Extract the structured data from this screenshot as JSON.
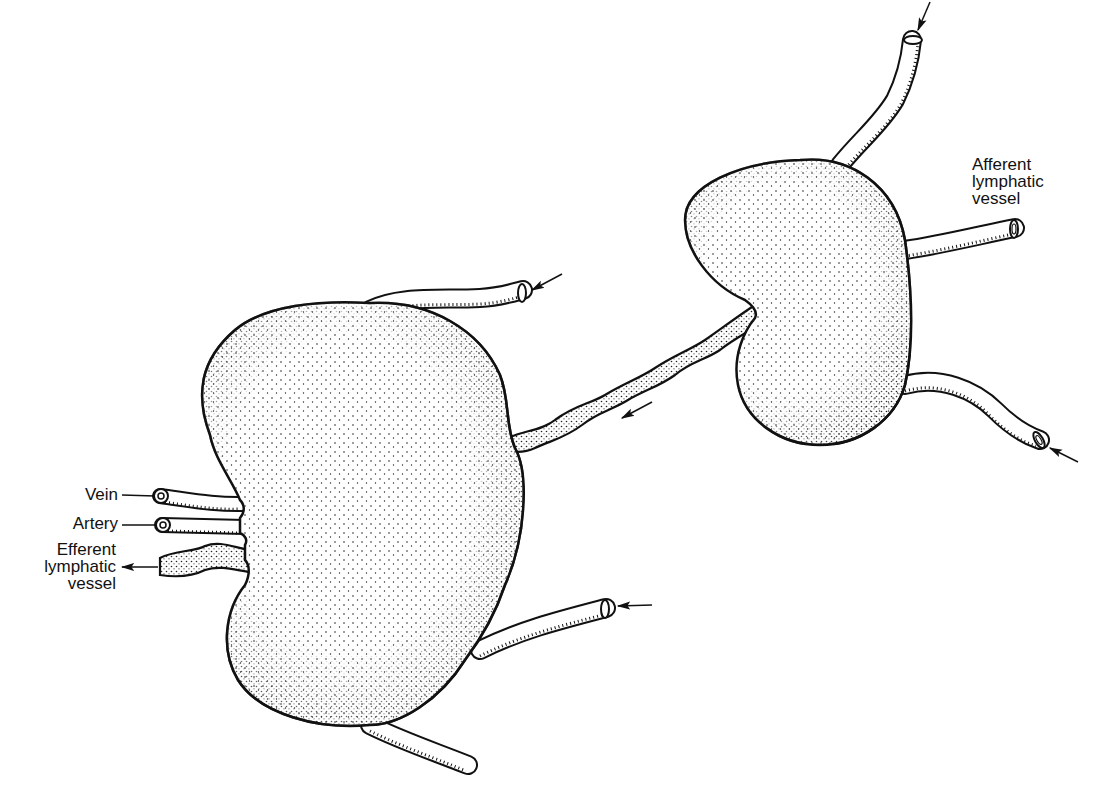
{
  "diagram": {
    "type": "anatomical illustration",
    "labels": {
      "vein": "Vein",
      "artery": "Artery",
      "efferent_1": "Efferent",
      "efferent_2": "lymphatic",
      "efferent_3": "vessel",
      "afferent_1": "Afferent",
      "afferent_2": "lymphatic",
      "afferent_3": "vessel"
    },
    "nodes": [
      {
        "name": "large-lymph-node",
        "position": "left"
      },
      {
        "name": "small-lymph-node",
        "position": "upper-right"
      }
    ],
    "arrows": [
      {
        "name": "arrow-top-right-vessel",
        "direction": "into small node"
      },
      {
        "name": "arrow-right-vessel",
        "direction": "into small node"
      },
      {
        "name": "arrow-lower-right-vessel",
        "direction": "into small node"
      },
      {
        "name": "arrow-connecting-vessel",
        "direction": "toward large node"
      },
      {
        "name": "arrow-upper-vessel-large",
        "direction": "into large node"
      },
      {
        "name": "arrow-lower-vessel-large",
        "direction": "into large node"
      },
      {
        "name": "arrow-efferent",
        "direction": "out of large node"
      }
    ],
    "colors": {
      "ink": "#111111",
      "background": "#ffffff",
      "stipple": "#222222"
    }
  }
}
